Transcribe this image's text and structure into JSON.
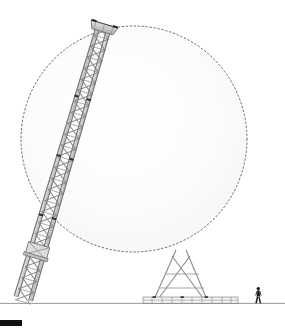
{
  "canvas": {
    "width": 285,
    "height": 330,
    "background": "#ffffff"
  },
  "drawing": {
    "title": "Tilting lattice mast elevation with rotation sweep circle",
    "type": "technical-elevation-line-drawing"
  },
  "colors": {
    "background": "#ffffff",
    "ground_line": "#8d8d8d",
    "circle_stroke": "#5a5a5a",
    "circle_fill": "#fbfbfb",
    "lattice_stroke": "#8f8f8f",
    "lattice_stroke_dark": "#6e6e6e",
    "chord_fill": "#d9d9d9",
    "joint_dark": "#2b2b2b",
    "human_figure": "#1a1a1a",
    "corner_mark": "#111111",
    "base_rail": "#9a9a9a"
  },
  "sweep_circle": {
    "label": "rotation-sweep-circle",
    "center_x": 134,
    "center_y": 139,
    "radius": 113,
    "stroke_width": 0.9,
    "dash_pattern": "1.6 2.4",
    "fill": "#fbfbfb"
  },
  "mast": {
    "label": "tilting-lattice-mast",
    "tilt_degrees": 12.5,
    "top_x": 104,
    "top_y": 26,
    "base_x": 186,
    "base_y": 303,
    "width_top": 15,
    "width_base": 19,
    "panel_count": 26,
    "bracing": "X-brace lattice",
    "joints": [
      {
        "name": "mast-cap-joint",
        "x": 104,
        "y": 28
      },
      {
        "name": "mast-upper-splice",
        "x": 125,
        "y": 98
      },
      {
        "name": "mast-mid-splice",
        "x": 142,
        "y": 155
      },
      {
        "name": "mast-lower-splice",
        "x": 160,
        "y": 216
      },
      {
        "name": "mast-pivot-joint",
        "x": 171,
        "y": 250
      }
    ]
  },
  "mast_cap": {
    "label": "mast-top-platform",
    "x": 90,
    "y": 24,
    "width": 28,
    "height": 8
  },
  "pivot_collar": {
    "label": "pivot-collar",
    "x": 158,
    "y": 240,
    "width": 32,
    "height": 16
  },
  "base_frame": {
    "label": "base-rail-frame",
    "x": 143,
    "y": 297,
    "width": 95,
    "height": 8,
    "tie_count": 9
  },
  "base_legs": {
    "label": "base-a-frame-legs",
    "left_foot_x": 155,
    "right_foot_x": 205,
    "apex_x": 182,
    "apex_y": 252,
    "foot_y": 302
  },
  "ground": {
    "label": "ground-line",
    "y": 303,
    "x_start": 0,
    "x_end": 285,
    "stroke_width": 0.9
  },
  "human_figure": {
    "label": "human-scale-figure",
    "x": 258,
    "y_top": 287,
    "y_bottom": 303,
    "height": 16
  },
  "corner_mark": {
    "label": "page-corner-registration-mark",
    "x": 0,
    "y": 320,
    "width": 22,
    "height": 6
  }
}
